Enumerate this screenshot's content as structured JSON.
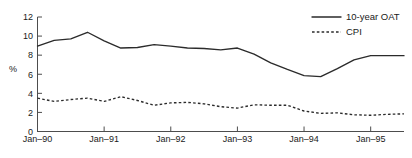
{
  "chart_data": {
    "type": "line",
    "title": "",
    "subtitle": "",
    "xlabel": "",
    "ylabel": "%",
    "ylim": [
      0,
      12
    ],
    "xlim": [
      1990.0,
      1995.5
    ],
    "yticks": [
      0,
      2,
      4,
      6,
      8,
      10,
      12
    ],
    "ytick_labels": [
      "0",
      "2",
      "4",
      "6",
      "8",
      "10",
      "12"
    ],
    "xticks": [
      1990.0,
      1991.0,
      1992.0,
      1993.0,
      1994.0,
      1995.0
    ],
    "xtick_labels": [
      "Jan–90",
      "Jan–91",
      "Jan–92",
      "Jan–93",
      "Jan–94",
      "Jan–95"
    ],
    "grid": false,
    "legend_position": "top-right",
    "line_color": "#2b2b2b",
    "axis_color": "#4d4d4d",
    "x": [
      1990.0,
      1990.25,
      1990.5,
      1990.75,
      1991.0,
      1991.25,
      1991.5,
      1991.75,
      1992.0,
      1992.25,
      1992.5,
      1992.75,
      1993.0,
      1993.25,
      1993.5,
      1993.75,
      1994.0,
      1994.25,
      1994.5,
      1994.75,
      1995.0,
      1995.25,
      1995.5
    ],
    "series": [
      {
        "name": "10-year OAT",
        "style": "solid",
        "values": [
          8.95,
          9.55,
          9.7,
          10.4,
          9.5,
          8.75,
          8.8,
          9.1,
          8.95,
          8.75,
          8.7,
          8.55,
          8.75,
          8.1,
          7.2,
          6.5,
          5.85,
          5.75,
          6.6,
          7.5,
          7.95,
          7.95,
          7.95
        ]
      },
      {
        "name": "CPI",
        "style": "dotted",
        "values": [
          3.5,
          3.15,
          3.35,
          3.5,
          3.15,
          3.65,
          3.25,
          2.75,
          3.0,
          3.05,
          2.9,
          2.6,
          2.45,
          2.8,
          2.75,
          2.75,
          2.15,
          1.9,
          1.95,
          1.75,
          1.7,
          1.8,
          1.85
        ]
      }
    ],
    "legend": [
      {
        "label": "10-year OAT",
        "style": "solid"
      },
      {
        "label": "CPI",
        "style": "dotted"
      }
    ]
  }
}
